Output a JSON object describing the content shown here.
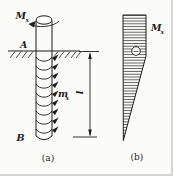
{
  "figure": {
    "colors": {
      "background": "#fbfbf8",
      "line": "#1d1d1b"
    },
    "labels": {
      "applied_moment": {
        "base": "M",
        "sub": "x"
      },
      "point_a": "A",
      "point_b": "B",
      "distributed_moment": {
        "base": "m",
        "sub": "x"
      },
      "embedded_length": "l",
      "torque_diagram_moment": {
        "base": "M",
        "sub": "x"
      },
      "negative_sign": "−",
      "caption_left": "(a)",
      "caption_right": "(b)"
    },
    "torque_diagram": {
      "profile": "constant width from top to ground level, linear taper to a point at the bottom tip",
      "sign_marker": "circled minus",
      "hatching": "horizontal lines"
    }
  }
}
